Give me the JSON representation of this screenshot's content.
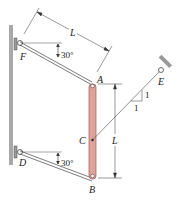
{
  "figure": {
    "type": "statics-diagram",
    "colors": {
      "bar": "#e0a39b",
      "bar_edge": "#9c5a55",
      "wall": "#a9a9a9",
      "ink": "#333333"
    },
    "labels": {
      "point_A": "A",
      "point_B": "B",
      "point_C": "C",
      "point_D": "D",
      "point_E": "E",
      "point_F": "F",
      "length_top": "L",
      "length_bar": "L",
      "angle_top": "30°",
      "angle_bottom": "30°",
      "slope_rise": "1",
      "slope_run": "1"
    }
  }
}
